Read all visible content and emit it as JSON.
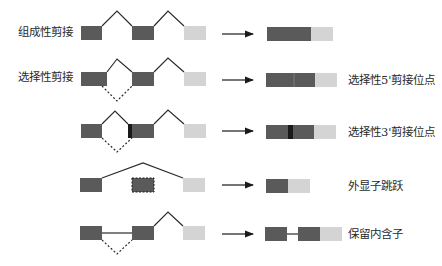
{
  "diagram": {
    "colors": {
      "exon_dark": "#5a5a5a",
      "exon_light": "#d4d4d4",
      "exon_mark": "#1a1a1a",
      "line": "#2b2b2b"
    },
    "left_labels": [
      {
        "row": 0,
        "text": "组成性剪接"
      },
      {
        "row": 1,
        "text": "选择性剪接"
      }
    ],
    "rows": [
      {
        "name": "constitutive-splicing",
        "right_label": ""
      },
      {
        "name": "alt-5prime-site",
        "right_label": "选择性5'剪接位点"
      },
      {
        "name": "alt-3prime-site",
        "right_label": "选择性3'剪接位点"
      },
      {
        "name": "exon-skipping",
        "right_label": "外显子跳跃"
      },
      {
        "name": "intron-retention",
        "right_label": "保留内含子"
      }
    ]
  }
}
